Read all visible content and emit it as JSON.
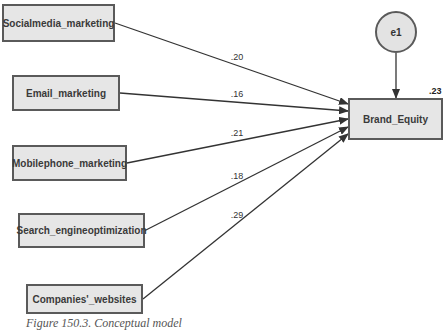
{
  "diagram": {
    "type": "path-model",
    "exogenous": [
      {
        "id": "smm",
        "label": "Socialmedia_marketing",
        "coef": ".20",
        "box": [
          2,
          4,
          113,
          38
        ],
        "end_y": 104
      },
      {
        "id": "em",
        "label": "Email_marketing",
        "coef": ".16",
        "box": [
          12,
          75,
          108,
          36
        ],
        "end_y": 111
      },
      {
        "id": "mpm",
        "label": "Mobilephone_marketing",
        "coef": ".21",
        "box": [
          12,
          145,
          115,
          36
        ],
        "end_y": 119
      },
      {
        "id": "seo",
        "label": "Search_engineoptimization",
        "coef": ".18",
        "box": [
          18,
          213,
          127,
          35
        ],
        "end_y": 127
      },
      {
        "id": "cw",
        "label": "Companies'_websites",
        "coef": ".29",
        "box": [
          26,
          284,
          117,
          30
        ],
        "end_y": 134
      }
    ],
    "endogenous": {
      "label": "Brand_Equity",
      "r_squared": ".23",
      "box": [
        348,
        98,
        95,
        42
      ]
    },
    "error": {
      "label": "e1",
      "cx": 396,
      "cy": 32,
      "r": 21
    },
    "colors": {
      "node_fill": "#e6e6e6",
      "node_border": "#5a5a5a",
      "line": "#333333"
    }
  },
  "caption": "Figure 150.3. Conceptual model"
}
